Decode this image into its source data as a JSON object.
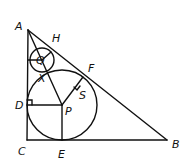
{
  "diagram": {
    "type": "geometry",
    "stroke_color": "#111111",
    "background": "#ffffff",
    "labels": {
      "A": "A",
      "B": "B",
      "C": "C",
      "D": "D",
      "E": "E",
      "F": "F",
      "H": "H",
      "P": "P",
      "Q": "Q",
      "S": "S",
      "X": "X"
    },
    "points": {
      "A": [
        28,
        30
      ],
      "B": [
        167,
        140
      ],
      "C": [
        27,
        140
      ],
      "D": [
        27,
        105
      ],
      "E": [
        62,
        140
      ],
      "F": [
        83,
        77
      ],
      "P": [
        62,
        105
      ],
      "Q": [
        42,
        60
      ],
      "S": [
        78,
        88
      ]
    },
    "circles": [
      {
        "name": "incircle-P",
        "center": [
          62,
          105
        ],
        "r": 35
      },
      {
        "name": "circle-Q",
        "center": [
          42,
          60
        ],
        "r": 12
      }
    ]
  }
}
